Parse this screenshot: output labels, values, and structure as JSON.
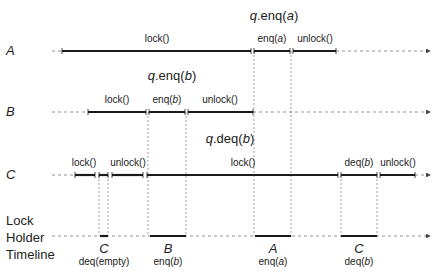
{
  "diagram": {
    "rows": [
      {
        "id": "A",
        "label": "A"
      },
      {
        "id": "B",
        "label": "B"
      },
      {
        "id": "C",
        "label": "C"
      }
    ],
    "timeline_label": [
      "Lock",
      "Holder",
      "Timeline"
    ],
    "headers": {
      "a_enq": {
        "obj": "q",
        "method": ".enq(",
        "arg": "a",
        "close": ")"
      },
      "b_enq": {
        "obj": "q",
        "method": ".enq(",
        "arg": "b",
        "close": ")"
      },
      "c_deq": {
        "obj": "q",
        "method": ".deq(",
        "arg": "b",
        "close": ")"
      }
    },
    "row_a": {
      "lock": "lock()",
      "enq": {
        "pre": "enq(",
        "arg": "a",
        "post": ")"
      },
      "unlock": "unlock()"
    },
    "row_b": {
      "lock": "lock()",
      "enq": {
        "pre": "enq(",
        "arg": "b",
        "post": ")"
      },
      "unlock": "unlock()"
    },
    "row_c": {
      "lock1": "lock()",
      "unlock1": "unlock()",
      "lock2": "lock()",
      "deq": {
        "pre": "deq(",
        "arg": "b",
        "post": ")"
      },
      "unlock2": "unlock()"
    },
    "holders": [
      {
        "thread": "C",
        "op": "deq(empty)"
      },
      {
        "thread": "B",
        "op_pre": "enq(",
        "op_arg": "b",
        "op_post": ")"
      },
      {
        "thread": "A",
        "op_pre": "enq(",
        "op_arg": "a",
        "op_post": ")"
      },
      {
        "thread": "C",
        "op_pre": "deq(",
        "op_arg": "b",
        "op_post": ")"
      }
    ],
    "colors": {
      "line": "#1a1a1a",
      "dashed": "#777777"
    }
  }
}
